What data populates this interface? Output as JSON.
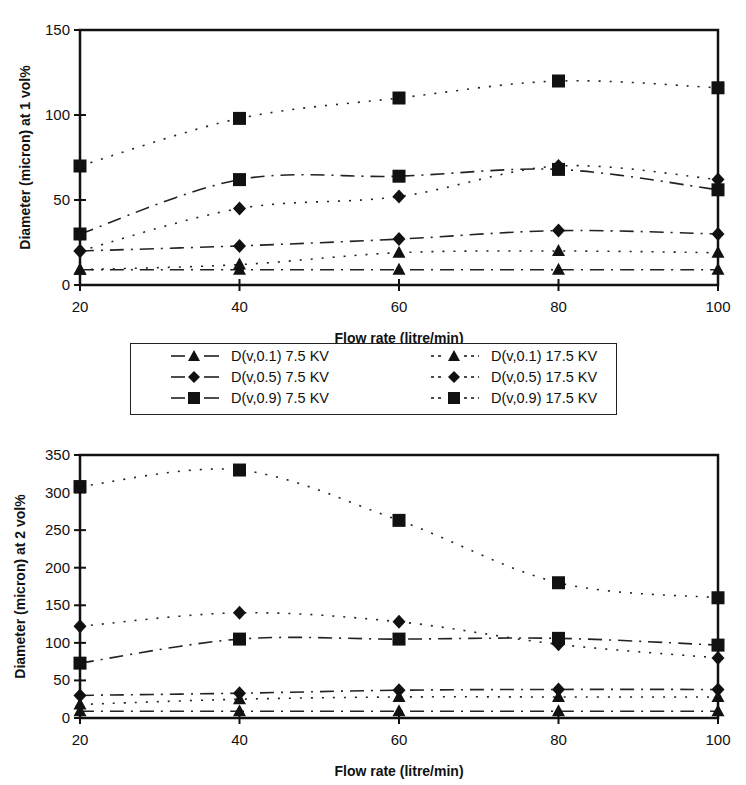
{
  "chart_data": [
    {
      "type": "line",
      "title": "",
      "xlabel": "Flow rate (litre/min)",
      "ylabel": "Diameter (micron) at 1 vol%",
      "x": [
        20,
        40,
        60,
        80,
        100
      ],
      "xticks": [
        "20",
        "40",
        "60",
        "80",
        "100"
      ],
      "yticks": [
        "0",
        "50",
        "100",
        "150"
      ],
      "ylim": [
        0,
        150
      ],
      "xlim": [
        20,
        100
      ],
      "grid": false,
      "series": [
        {
          "name": "D(v,0.1) 7.5 KV",
          "marker": "triangle",
          "line": "dash-dot",
          "values": [
            9,
            9,
            9,
            9,
            9
          ]
        },
        {
          "name": "D(v,0.5) 7.5 KV",
          "marker": "diamond",
          "line": "dash-dot",
          "values": [
            20,
            23,
            27,
            32,
            30
          ]
        },
        {
          "name": "D(v,0.9) 7.5 KV",
          "marker": "square",
          "line": "dash-dot",
          "values": [
            30,
            62,
            64,
            68,
            56
          ]
        },
        {
          "name": "D(v,0.1) 17.5 KV",
          "marker": "triangle",
          "line": "dotted",
          "values": [
            9,
            12,
            19,
            20,
            19
          ]
        },
        {
          "name": "D(v,0.5) 17.5 KV",
          "marker": "diamond",
          "line": "dotted",
          "values": [
            20,
            45,
            52,
            70,
            62
          ]
        },
        {
          "name": "D(v,0.9) 17.5 KV",
          "marker": "square",
          "line": "dotted",
          "values": [
            70,
            98,
            110,
            120,
            116
          ]
        }
      ]
    },
    {
      "type": "line",
      "title": "",
      "xlabel": "Flow rate (litre/min)",
      "ylabel": "Diameter (micron) at 2 vol%",
      "x": [
        20,
        40,
        60,
        80,
        100
      ],
      "xticks": [
        "20",
        "40",
        "60",
        "80",
        "100"
      ],
      "yticks": [
        "0",
        "50",
        "100",
        "150",
        "200",
        "250",
        "300",
        "350"
      ],
      "ylim": [
        0,
        350
      ],
      "xlim": [
        20,
        100
      ],
      "grid": false,
      "series": [
        {
          "name": "D(v,0.1) 7.5 KV",
          "marker": "triangle",
          "line": "dash-dot",
          "values": [
            9,
            9,
            9,
            9,
            9
          ]
        },
        {
          "name": "D(v,0.5) 7.5 KV",
          "marker": "diamond",
          "line": "dash-dot",
          "values": [
            30,
            33,
            37,
            38,
            38
          ]
        },
        {
          "name": "D(v,0.9) 7.5 KV",
          "marker": "square",
          "line": "dash-dot",
          "values": [
            73,
            105,
            105,
            106,
            97
          ]
        },
        {
          "name": "D(v,0.1) 17.5 KV",
          "marker": "triangle",
          "line": "dotted",
          "values": [
            18,
            25,
            28,
            28,
            28
          ]
        },
        {
          "name": "D(v,0.5) 17.5 KV",
          "marker": "diamond",
          "line": "dotted",
          "values": [
            122,
            140,
            128,
            98,
            80
          ]
        },
        {
          "name": "D(v,0.9) 17.5 KV",
          "marker": "square",
          "line": "dotted",
          "values": [
            308,
            330,
            263,
            180,
            160
          ]
        }
      ]
    }
  ],
  "legend": {
    "items": [
      {
        "label": "D(v,0.1) 7.5 KV",
        "marker": "triangle",
        "line": "solid"
      },
      {
        "label": "D(v,0.1) 17.5 KV",
        "marker": "triangle",
        "line": "dotted"
      },
      {
        "label": "D(v,0.5) 7.5 KV",
        "marker": "diamond",
        "line": "solid"
      },
      {
        "label": "D(v,0.5) 17.5 KV",
        "marker": "diamond",
        "line": "dotted"
      },
      {
        "label": "D(v,0.9) 7.5 KV",
        "marker": "square",
        "line": "solid"
      },
      {
        "label": "D(v,0.9) 17.5 KV",
        "marker": "square",
        "line": "dotted"
      }
    ]
  },
  "colors": {
    "ink": "#111111",
    "background": "#ffffff"
  }
}
